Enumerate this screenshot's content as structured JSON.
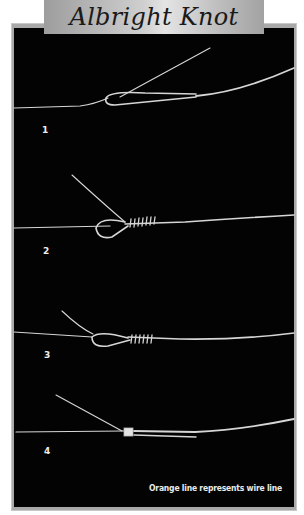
{
  "title": "Albright Knot",
  "steps": [
    {
      "number": "1"
    },
    {
      "number": "2"
    },
    {
      "number": "3"
    },
    {
      "number": "4"
    }
  ],
  "caption": "Orange line represents wire line",
  "colors": {
    "panel": "#030303",
    "frame": "#a9a9a9",
    "line": "#d8d8d8",
    "banner": "#cfcfcf"
  }
}
